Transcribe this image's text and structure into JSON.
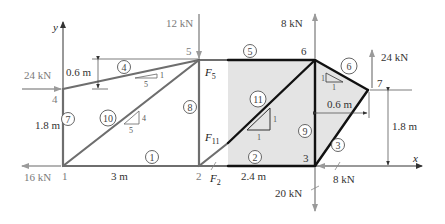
{
  "diagram": {
    "axes": {
      "x_label": "x",
      "y_label": "y"
    },
    "nodes": [
      {
        "id": "1",
        "label": "1"
      },
      {
        "id": "2",
        "label": "2"
      },
      {
        "id": "3",
        "label": "3"
      },
      {
        "id": "4",
        "label": "4"
      },
      {
        "id": "5",
        "label": "5"
      },
      {
        "id": "6",
        "label": "6"
      },
      {
        "id": "7",
        "label": "7"
      }
    ],
    "members": [
      {
        "id": "1",
        "label": "1",
        "from": "1",
        "to": "2"
      },
      {
        "id": "2",
        "label": "2",
        "from": "2",
        "to": "3"
      },
      {
        "id": "3",
        "label": "3",
        "from": "3",
        "to": "7"
      },
      {
        "id": "4",
        "label": "4",
        "from": "4",
        "to": "5"
      },
      {
        "id": "5",
        "label": "5",
        "from": "5",
        "to": "6"
      },
      {
        "id": "6",
        "label": "6",
        "from": "6",
        "to": "7"
      },
      {
        "id": "7",
        "label": "7",
        "from": "1",
        "to": "4"
      },
      {
        "id": "8",
        "label": "8",
        "from": "2",
        "to": "5"
      },
      {
        "id": "9",
        "label": "9",
        "from": "3",
        "to": "6"
      },
      {
        "id": "10",
        "label": "10",
        "from": "1",
        "to": "5"
      },
      {
        "id": "11",
        "label": "11",
        "from": "2",
        "to": "6"
      }
    ],
    "loads": {
      "n4": "24 kN",
      "n5": "12 kN",
      "n6": "8 kN",
      "n7": "24 kN",
      "n1": "16 kN",
      "n3_down": "20 kN",
      "n3_left": "8 kN"
    },
    "dimensions": {
      "d_4_5_rise": "0.6 m",
      "d_1_4": "1.8 m",
      "d_1_2": "3 m",
      "d_2_3": "2.4 m",
      "d_3_7_horiz": "0.6 m",
      "d_7_height": "1.8 m"
    },
    "slopes": {
      "member4": {
        "run": "5",
        "rise": "1"
      },
      "member10": {
        "run": "5",
        "rise": "4"
      },
      "member11": {
        "run": "1",
        "rise": "1"
      },
      "member6": {
        "run": "1",
        "rise": "1"
      }
    },
    "force_labels": {
      "F5": {
        "main": "F",
        "sub": "5"
      },
      "F11": {
        "main": "F",
        "sub": "11"
      },
      "F2": {
        "main": "F",
        "sub": "2"
      }
    }
  }
}
